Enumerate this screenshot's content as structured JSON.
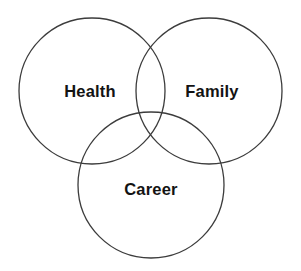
{
  "diagram": {
    "type": "venn",
    "title": "",
    "background_color": "#ffffff",
    "stroke_color": "#3c3c3c",
    "stroke_width": 1.3,
    "label_color": "#131313",
    "sets": [
      {
        "id": "health",
        "label": "Health",
        "icon": "circle-outline-icon",
        "cx": 92,
        "cy": 91,
        "r": 73,
        "label_x": 90,
        "label_y": 93
      },
      {
        "id": "family",
        "label": "Family",
        "icon": "circle-outline-icon",
        "cx": 209,
        "cy": 91,
        "r": 73,
        "label_x": 212,
        "label_y": 93
      },
      {
        "id": "career",
        "label": "Career",
        "icon": "circle-outline-icon",
        "cx": 151,
        "cy": 185,
        "r": 73,
        "label_x": 151,
        "label_y": 191
      }
    ]
  }
}
